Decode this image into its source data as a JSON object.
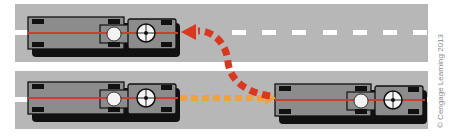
{
  "diagram": {
    "colors": {
      "road": "#b7b7b7",
      "lane_marking": "#ffffff",
      "vehicle_body": "#8c8c8c",
      "vehicle_outline": "#111111",
      "centerline": "#c8412f",
      "path_red": "#d9381e",
      "path_orange": "#f0a33a"
    },
    "vehicles": [
      {
        "id": "top-vehicle",
        "lane": "upper",
        "x": 30,
        "facing": "right"
      },
      {
        "id": "bottom-left-vehicle",
        "lane": "lower",
        "x": 30,
        "facing": "right"
      },
      {
        "id": "bottom-right-vehicle",
        "lane": "lower",
        "x": 272,
        "facing": "right"
      }
    ],
    "paths": [
      {
        "id": "red-curved-arrow",
        "color": "red",
        "from": "lower lane",
        "to": "upper lane",
        "style": "dashed-arrow"
      },
      {
        "id": "orange-straight-arrow",
        "color": "orange",
        "from": "bottom-left-vehicle",
        "to": "bottom-right-vehicle",
        "style": "dashed-arrow"
      }
    ]
  },
  "credit": "© Cengage Learning 2013"
}
